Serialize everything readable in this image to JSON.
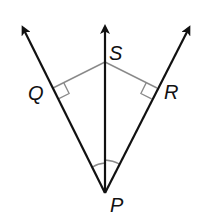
{
  "figure": {
    "points": {
      "P": {
        "label": "P",
        "x": 105,
        "y": 193
      },
      "S": {
        "label": "S",
        "x": 105,
        "y": 62
      },
      "Q": {
        "label": "Q",
        "x": 53,
        "y": 88
      },
      "R": {
        "label": "R",
        "x": 157,
        "y": 88
      }
    },
    "rays": [
      {
        "name": "ray-PQ",
        "from": "P",
        "through": "Q",
        "tip": [
          22,
          26
        ]
      },
      {
        "name": "ray-PS",
        "from": "P",
        "through": "S",
        "tip": [
          105,
          25
        ]
      },
      {
        "name": "ray-PR",
        "from": "P",
        "through": "R",
        "tip": [
          190,
          26
        ]
      }
    ],
    "segments": [
      {
        "name": "segment-SQ",
        "from": "S",
        "to": "Q"
      },
      {
        "name": "segment-SR",
        "from": "S",
        "to": "R"
      }
    ],
    "markers": {
      "right_angles": [
        "Q",
        "R"
      ],
      "congruent_angles": [
        "QPS",
        "SPR"
      ]
    },
    "colors": {
      "ray": "#111111",
      "segment": "#8a8a8a",
      "marker": "#8a8a8a"
    }
  }
}
